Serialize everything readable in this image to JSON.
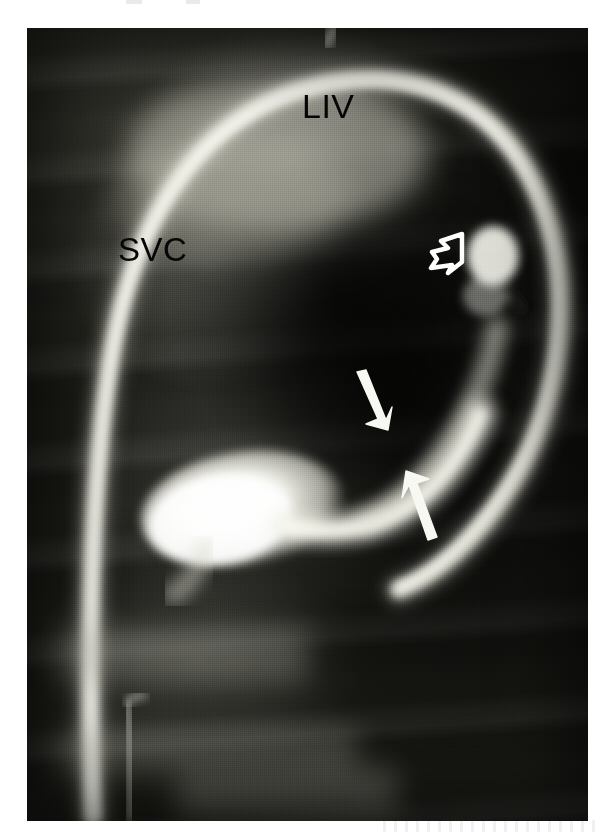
{
  "figure": {
    "type": "radiograph",
    "modality": "contrast venogram / angiogram",
    "projection": "frontal",
    "plate": {
      "left": 27,
      "top": 28,
      "width": 561,
      "height": 793,
      "background_color": "#14140f"
    }
  },
  "labels": [
    {
      "id": "liv",
      "text": "LIV",
      "meaning": "left innominate vein",
      "color": "#060606",
      "x": 302,
      "y": 89,
      "font_size": 34
    },
    {
      "id": "svc",
      "text": "SVC",
      "meaning": "superior vena cava",
      "color": "#060606",
      "x": 118,
      "y": 233,
      "font_size": 33
    }
  ],
  "markers": [
    {
      "id": "open-arrowhead",
      "style": "open",
      "color": "#ffffff",
      "direction": "up-right",
      "tip_x": 465,
      "tip_y": 233,
      "tail_x": 432,
      "tail_y": 268
    },
    {
      "id": "solid-arrow-upper",
      "style": "solid",
      "color": "#f6f6f2",
      "direction": "down-right",
      "tip_x": 381,
      "tip_y": 427,
      "tail_x": 357,
      "tail_y": 373
    },
    {
      "id": "solid-arrow-lower",
      "style": "solid",
      "color": "#f6f6f2",
      "direction": "up-left",
      "tip_x": 407,
      "tip_y": 472,
      "tail_x": 436,
      "tail_y": 537
    }
  ],
  "structures": [
    {
      "id": "svc-trunk",
      "name": "superior vena cava",
      "appearance": "vertical opacified vessel descending along left side of plate"
    },
    {
      "id": "liv-arch",
      "name": "left innominate vein arch",
      "appearance": "bright contrast-filled arch across the top of the plate"
    },
    {
      "id": "contrast-pool",
      "name": "contrast-filled central venous pouch",
      "appearance": "bright bulbous opacity in the mid-lower field"
    },
    {
      "id": "catheter",
      "name": "catheter tip",
      "appearance": "thin bright linear density in the lower-left field"
    }
  ],
  "page_artifacts": [
    {
      "x": 126,
      "y": 0,
      "width": 16,
      "height": 4
    },
    {
      "x": 186,
      "y": 0,
      "width": 14,
      "height": 4
    },
    {
      "x": 383,
      "y": 819,
      "width": 220,
      "height": 14
    }
  ]
}
